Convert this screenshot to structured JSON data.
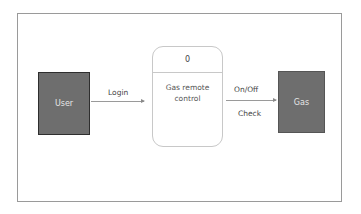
{
  "diagram": {
    "type": "data-flow-diagram-level-0",
    "entities": [
      {
        "id": "user",
        "label": "User",
        "color": "#6e6e6e"
      },
      {
        "id": "gas",
        "label": "Gas",
        "color": "#6e6e6e"
      }
    ],
    "process": {
      "number": "0",
      "name": "Gas remote control"
    },
    "flows": [
      {
        "from": "user",
        "to": "process",
        "label": "Login"
      },
      {
        "from": "process",
        "to": "gas",
        "labels": [
          "On/Off",
          "Check"
        ]
      }
    ]
  },
  "labels": {
    "user": "User",
    "gas": "Gas",
    "process_id": "0",
    "process_name": "Gas remote control",
    "login": "Login",
    "onoff": "On/Off",
    "check": "Check"
  }
}
